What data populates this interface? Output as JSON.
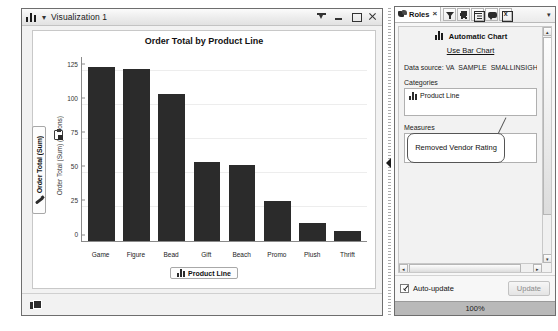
{
  "viz_window": {
    "title": "Visualization 1",
    "app_icon": "bar-chart-icon",
    "menu_caret": "▾",
    "buttons": [
      {
        "name": "pin-button",
        "label": ""
      },
      {
        "name": "minimize-button",
        "label": ""
      },
      {
        "name": "maximize-button",
        "label": ""
      },
      {
        "name": "close-button",
        "label": ""
      }
    ]
  },
  "chart_data": {
    "type": "bar",
    "title": "Order Total by Product Line",
    "categories": [
      "Game",
      "Figure",
      "Bead",
      "Gift",
      "Beach",
      "Promo",
      "Plush",
      "Thrift"
    ],
    "values": [
      128,
      126,
      108,
      58,
      56,
      29,
      13,
      7
    ],
    "xlabel": "Product Line",
    "ylabel": "Order Total (Sum)",
    "ylabel_units": "(millions)",
    "ylim": [
      0,
      135
    ],
    "yticks": [
      0,
      25,
      50,
      75,
      100,
      125
    ],
    "ytick_labels": [
      "0",
      "25",
      "50",
      "75",
      "100",
      "125"
    ],
    "grid": true,
    "legend": "none",
    "bar_color": "#2b2b2b"
  },
  "chart_roles": {
    "y_chip_label": "Order Total (Sum)",
    "y_chip_icon": "measure-icon",
    "x_chip_label": "Product Line",
    "x_chip_icon": "category-icon",
    "clipboard_icon": "clipboard-icon"
  },
  "splitter": {
    "collapse_icon": "collapse-right-arrow-icon"
  },
  "roles_panel": {
    "tab": {
      "label": "Roles",
      "icon": "roles-icon",
      "close": "×"
    },
    "toolbar_icons": [
      {
        "name": "filters-icon",
        "title": "Filters"
      },
      {
        "name": "ranks-icon",
        "title": "Ranks"
      },
      {
        "name": "properties-icon",
        "title": "Properties"
      },
      {
        "name": "comments-icon",
        "title": "Comments"
      },
      {
        "name": "export-icon",
        "title": "Export"
      }
    ],
    "overflow": "▾",
    "automatic_chart": {
      "label": "Automatic Chart",
      "icon": "bar-chart-icon"
    },
    "use_bar_chart_link": "Use Bar Chart",
    "data_source": "Data source: VA_SAMPLE_SMALLINSIGH",
    "categories_label": "Categories",
    "category_item": {
      "label": "Product Line",
      "icon": "category-icon"
    },
    "measures_label": "Measures",
    "measure_item": {
      "label": "Order Total",
      "icon": "measure-icon"
    },
    "callout": "Removed Vendor Rating",
    "scroll_up": "▴",
    "scroll_down": "▾",
    "scroll_left": "◂",
    "scroll_right": "▸",
    "auto_update_label": "Auto-update",
    "auto_update_checked": true,
    "update_button": "Update",
    "progress_label": "100%"
  },
  "viz_footer": {
    "icon": "copy-pages-icon"
  }
}
